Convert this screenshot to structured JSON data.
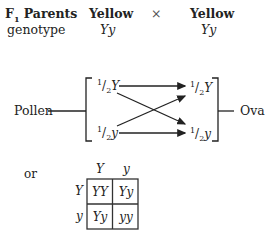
{
  "header": {
    "row1_label": "F",
    "row1_label_sub": "1",
    "row1_label_rest": " Parents",
    "parent1_phenotype": "Yellow",
    "cross_symbol": "×",
    "parent2_phenotype": "Yellow",
    "row2_label": "genotype",
    "parent1_genotype": "Yy",
    "parent2_genotype": "Yy"
  },
  "gamete_diagram": {
    "left_label": "Pollen",
    "right_label": "Ova",
    "left_gametes": [
      {
        "num": "1",
        "den": "2",
        "allele": "Y"
      },
      {
        "num": "1",
        "den": "2",
        "allele": "y"
      }
    ],
    "right_gametes": [
      {
        "num": "1",
        "den": "2",
        "allele": "Y"
      },
      {
        "num": "1",
        "den": "2",
        "allele": "y"
      }
    ],
    "line_color": "#222222"
  },
  "punnett": {
    "connector": "or",
    "col_headers": [
      "Y",
      "y"
    ],
    "row_headers": [
      "Y",
      "y"
    ],
    "cells": [
      [
        "YY",
        "Yy"
      ],
      [
        "Yy",
        "yy"
      ]
    ]
  }
}
